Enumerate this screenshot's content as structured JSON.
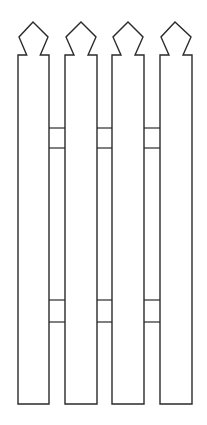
{
  "figure": {
    "stroke_color": "#2a2a2a",
    "background": "#ffffff",
    "pickets": [
      {
        "id": 1,
        "left": 18,
        "right": 49,
        "apex_x": 33
      },
      {
        "id": 2,
        "left": 65,
        "right": 97,
        "apex_x": 81
      },
      {
        "id": 3,
        "left": 112,
        "right": 144,
        "apex_x": 128
      },
      {
        "id": 4,
        "left": 160,
        "right": 192,
        "apex_x": 175
      }
    ],
    "rails": [
      {
        "name": "upper-rail",
        "top": 128,
        "bottom": 148
      },
      {
        "name": "lower-rail",
        "top": 300,
        "bottom": 322
      }
    ],
    "picket_top": 22,
    "shoulder_y": 55,
    "bottom_y": 404
  }
}
